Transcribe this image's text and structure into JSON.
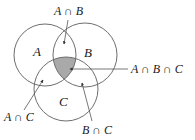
{
  "diagram": {
    "type": "venn",
    "sets": [
      {
        "id": "A",
        "label": "A"
      },
      {
        "id": "B",
        "label": "B"
      },
      {
        "id": "C",
        "label": "C"
      }
    ],
    "shaded_region": "A ∩ B ∩ C",
    "colors": {
      "outline": "#6e6e6e",
      "shade": "#a9a9a9",
      "text": "#1a1a1a"
    },
    "callouts": [
      {
        "id": "ab",
        "label": "A ∩ B"
      },
      {
        "id": "abc",
        "label": "A ∩ B ∩ C"
      },
      {
        "id": "ac",
        "label": "A ∩ C"
      },
      {
        "id": "bc",
        "label": "B ∩ C"
      }
    ]
  }
}
